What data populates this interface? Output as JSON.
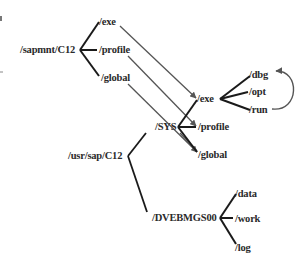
{
  "diagram": {
    "type": "directory-tree-mapping",
    "colors": {
      "line": "#1a1a1a",
      "arrow": "#555555",
      "text": "#2a2a2a",
      "background": "#ffffff"
    },
    "nodes": {
      "sapmnt": "/sapmnt/C12",
      "sapmnt_exe": "/exe",
      "sapmnt_profile": "/profile",
      "sapmnt_global": "/global",
      "usrsap": "/usr/sap/C12",
      "sys": "/SYS",
      "sys_exe": "/exe",
      "sys_profile": "/profile",
      "sys_global": "/global",
      "exe_dbg": "/dbg",
      "exe_opt": "/opt",
      "exe_run": "/run",
      "instance": "/DVEBMGS00",
      "inst_data": "/data",
      "inst_work": "/work",
      "inst_log": "/log"
    },
    "links": [
      {
        "from": "/sapmnt/C12/exe",
        "to": "/usr/sap/C12/SYS/exe",
        "kind": "link-arrow"
      },
      {
        "from": "/sapmnt/C12/profile",
        "to": "/usr/sap/C12/SYS/profile",
        "kind": "link-arrow"
      },
      {
        "from": "/sapmnt/C12/global",
        "to": "/usr/sap/C12/SYS/global",
        "kind": "link-arrow"
      },
      {
        "from": "/run",
        "to": "/dbg",
        "kind": "curved-arrow"
      }
    ]
  }
}
